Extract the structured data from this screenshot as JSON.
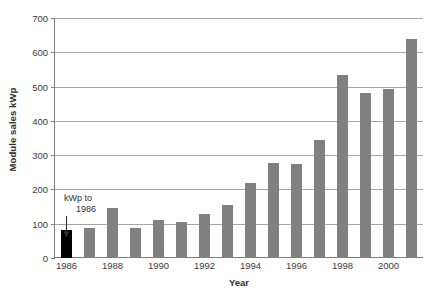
{
  "chart_data": {
    "type": "bar",
    "title": "",
    "xlabel": "Year",
    "ylabel": "Module sales kWp",
    "ylim": [
      0,
      700
    ],
    "ytick_step": 100,
    "yticks": [
      0,
      100,
      200,
      300,
      400,
      500,
      600,
      700
    ],
    "grid": true,
    "legend": "none",
    "categories": [
      "1986",
      "1987",
      "1988",
      "1989",
      "1990",
      "1991",
      "1992",
      "1993",
      "1994",
      "1995",
      "1996",
      "1997",
      "1998",
      "1999",
      "2000",
      "2001"
    ],
    "xtick_labels": [
      "1986",
      "1988",
      "1990",
      "1992",
      "1994",
      "1996",
      "1998",
      "2000"
    ],
    "values": [
      82,
      88,
      147,
      87,
      112,
      105,
      128,
      155,
      218,
      277,
      275,
      345,
      533,
      482,
      493,
      640
    ],
    "bar_colors": [
      "#000000",
      "#808080",
      "#808080",
      "#808080",
      "#808080",
      "#808080",
      "#808080",
      "#808080",
      "#808080",
      "#808080",
      "#808080",
      "#808080",
      "#808080",
      "#808080",
      "#808080",
      "#808080"
    ],
    "annotations": [
      {
        "name": "kwp-to-1986-note",
        "line1": "kWp to",
        "line2": "1986",
        "points_to_category": "1986"
      }
    ],
    "colors": {
      "bar_gray": "#808080",
      "bar_highlight": "#000000",
      "gridline": "#a6a6a6",
      "axis": "#7d7d7d",
      "text": "#3b3b3b",
      "background": "#ffffff"
    }
  }
}
